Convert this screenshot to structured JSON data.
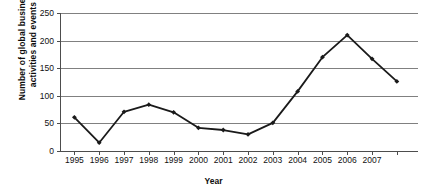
{
  "chart_data": {
    "type": "line",
    "title": "",
    "xlabel": "Year",
    "ylabel": "Number of global business activities and events",
    "ylabel_line1": "Number of global business",
    "ylabel_line2": "activities and events",
    "categories": [
      "1995",
      "1996",
      "1997",
      "1998",
      "1999",
      "2000",
      "2001",
      "2002",
      "2003",
      "2004",
      "2005",
      "2006",
      "2007",
      ""
    ],
    "x": [
      1995,
      1996,
      1997,
      1998,
      1999,
      2000,
      2001,
      2002,
      2003,
      2004,
      2005,
      2006,
      2007,
      2008
    ],
    "values": [
      61,
      15,
      71,
      84,
      70,
      42,
      38,
      30,
      51,
      108,
      170,
      210,
      167,
      126
    ],
    "series": [
      {
        "name": "Global business activities and events",
        "values": [
          61,
          15,
          71,
          84,
          70,
          42,
          38,
          30,
          51,
          108,
          170,
          210,
          167,
          126
        ]
      }
    ],
    "ylim": [
      0,
      250
    ],
    "yticks": [
      0,
      50,
      100,
      150,
      200,
      250
    ],
    "ytick_labels": [
      "0",
      "50",
      "100",
      "150",
      "200",
      "250"
    ],
    "xlim": [
      1995,
      2008
    ],
    "grid": "horizontal",
    "legend": "none",
    "marker": "diamond",
    "line_color": "#1a1a1a",
    "grid_color": "#808080",
    "axis_color": "#4d4d4d",
    "background": "#ffffff"
  }
}
